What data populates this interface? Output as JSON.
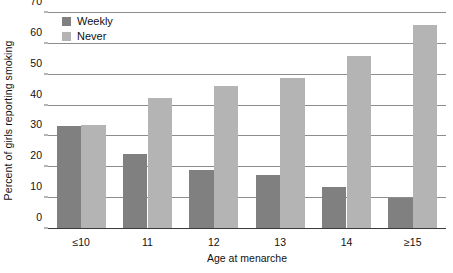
{
  "chart_data": {
    "type": "bar",
    "title": "",
    "xlabel": "Age at menarche",
    "ylabel": "Percent of girls reporting smoking",
    "categories": [
      "≤10",
      "11",
      "12",
      "13",
      "14",
      "≥15"
    ],
    "series": [
      {
        "name": "Weekly",
        "color": "#808080",
        "values": [
          33.4,
          24.3,
          19.0,
          17.5,
          13.5,
          10.2
        ]
      },
      {
        "name": "Never",
        "color": "#b4b4b4",
        "values": [
          33.6,
          42.5,
          46.5,
          49.0,
          56.0,
          66.0
        ]
      }
    ],
    "ylim": [
      0,
      70
    ],
    "yticks": [
      0,
      10,
      20,
      30,
      40,
      50,
      60,
      70
    ],
    "ytick_labels": [
      "0",
      "10",
      "20",
      "30",
      "40",
      "50",
      "60",
      "70"
    ],
    "grid": true,
    "legend_position": "top-left"
  },
  "legend": {
    "items": [
      {
        "label": "Weekly",
        "color": "#808080"
      },
      {
        "label": "Never",
        "color": "#b4b4b4"
      }
    ]
  },
  "axes": {
    "x_title": "Age at menarche",
    "y_title": "Percent of girls reporting smoking"
  }
}
